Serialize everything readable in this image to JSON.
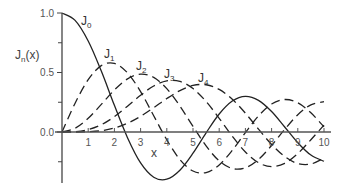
{
  "chart_data": {
    "type": "line",
    "title": "",
    "xlabel": "x",
    "ylabel": "J_n(x)",
    "xlim": [
      0,
      10
    ],
    "ylim": [
      -0.4,
      1.0
    ],
    "grid": false,
    "legend": "inline labels near curve peaks",
    "x_ticks": [
      "1",
      "2",
      "3",
      "4",
      "5",
      "6",
      "7",
      "8",
      "9",
      "10"
    ],
    "y_tick_labels": [
      "1.0",
      "0.5",
      "0.0"
    ],
    "y_minor_ticks": [
      0.75,
      0.25,
      -0.25
    ],
    "x": [
      0,
      0.5,
      1,
      1.5,
      2,
      2.5,
      3,
      3.5,
      4,
      4.5,
      5,
      5.5,
      6,
      6.5,
      7,
      7.5,
      8,
      8.5,
      9,
      9.5,
      10
    ],
    "series": [
      {
        "name": "J0",
        "label_main": "J",
        "label_sub": "0",
        "style": "solid",
        "values": [
          1.0,
          0.938,
          0.765,
          0.512,
          0.224,
          -0.048,
          -0.26,
          -0.38,
          -0.397,
          -0.321,
          -0.178,
          -0.007,
          0.151,
          0.26,
          0.3,
          0.266,
          0.172,
          0.042,
          -0.09,
          -0.194,
          -0.246
        ]
      },
      {
        "name": "J1",
        "label_main": "J",
        "label_sub": "1",
        "style": "dashed",
        "values": [
          0.0,
          0.242,
          0.44,
          0.558,
          0.577,
          0.497,
          0.339,
          0.137,
          -0.066,
          -0.231,
          -0.328,
          -0.341,
          -0.277,
          -0.154,
          -0.005,
          0.135,
          0.235,
          0.273,
          0.245,
          0.161,
          0.043
        ]
      },
      {
        "name": "J2",
        "label_main": "J",
        "label_sub": "2",
        "style": "dashed",
        "values": [
          0.0,
          0.031,
          0.115,
          0.232,
          0.353,
          0.446,
          0.486,
          0.459,
          0.364,
          0.218,
          0.047,
          -0.117,
          -0.243,
          -0.307,
          -0.301,
          -0.23,
          -0.113,
          0.022,
          0.145,
          0.228,
          0.255
        ]
      },
      {
        "name": "J3",
        "label_main": "J",
        "label_sub": "3",
        "style": "dashed",
        "values": [
          0.0,
          0.003,
          0.02,
          0.061,
          0.129,
          0.217,
          0.309,
          0.387,
          0.43,
          0.425,
          0.365,
          0.256,
          0.115,
          -0.035,
          -0.168,
          -0.258,
          -0.291,
          -0.263,
          -0.181,
          -0.065,
          0.058
        ]
      },
      {
        "name": "J4",
        "label_main": "J",
        "label_sub": "4",
        "style": "dashed",
        "values": [
          0.0,
          0.0,
          0.002,
          0.011,
          0.034,
          0.074,
          0.132,
          0.204,
          0.281,
          0.348,
          0.391,
          0.397,
          0.358,
          0.275,
          0.158,
          0.024,
          -0.105,
          -0.206,
          -0.265,
          -0.269,
          -0.22
        ]
      }
    ]
  }
}
